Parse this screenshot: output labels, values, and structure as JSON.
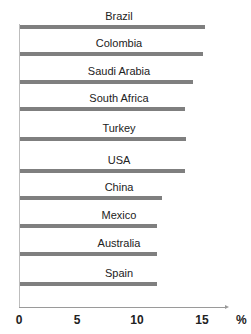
{
  "chart_data": {
    "type": "bar",
    "orientation": "horizontal",
    "title": "",
    "xlabel": "%",
    "ylabel": "",
    "categories": [
      "Brazil",
      "Colombia",
      "Saudi Arabia",
      "South Africa",
      "Turkey",
      "USA",
      "China",
      "Mexico",
      "Australia",
      "Spain"
    ],
    "values": [
      15.2,
      15.0,
      14.2,
      13.5,
      13.6,
      13.5,
      11.6,
      11.2,
      11.2,
      11.2
    ],
    "xlim": [
      0,
      17
    ],
    "xticks": [
      "0",
      "5",
      "10",
      "15"
    ],
    "grid": false,
    "legend": null,
    "bar_color": "#7f7f7f"
  }
}
